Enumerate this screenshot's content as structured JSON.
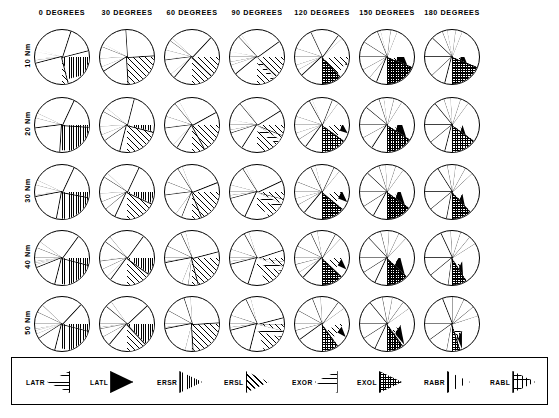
{
  "figure": {
    "title": "",
    "type": "pie-chart-matrix",
    "rows": 5,
    "columns": 7
  },
  "columns": [
    {
      "label": "0 DEGREES",
      "value": 0
    },
    {
      "label": "30 DEGREES",
      "value": 30
    },
    {
      "label": "60 DEGREES",
      "value": 60
    },
    {
      "label": "90 DEGREES",
      "value": 90
    },
    {
      "label": "120 DEGREES",
      "value": 120
    },
    {
      "label": "150 DEGREES",
      "value": 150
    },
    {
      "label": "180 DEGREES",
      "value": 180
    }
  ],
  "rows": [
    {
      "label": "10 Nm",
      "value": 10
    },
    {
      "label": "20 Nm",
      "value": 20
    },
    {
      "label": "30 Nm",
      "value": 30
    },
    {
      "label": "40 Nm",
      "value": 40
    },
    {
      "label": "50 Nm",
      "value": 50
    }
  ],
  "legend": {
    "items": [
      {
        "code": "LATR",
        "pattern": "horizontal-lines",
        "swatch": "p-latr",
        "direction": "right"
      },
      {
        "code": "LATL",
        "pattern": "solid-black",
        "swatch": "p-latl",
        "direction": "left"
      },
      {
        "code": "ERSR",
        "pattern": "dense-vertical-lines",
        "swatch": "p-ersr",
        "direction": "left"
      },
      {
        "code": "ERSL",
        "pattern": "diagonal-lines",
        "swatch": "p-ersl",
        "direction": "left"
      },
      {
        "code": "EXOR",
        "pattern": "sparse-horizontal-lines",
        "swatch": "p-exor",
        "direction": "right"
      },
      {
        "code": "EXOL",
        "pattern": "dense-crosshatch",
        "swatch": "p-exol",
        "direction": "left"
      },
      {
        "code": "RABR",
        "pattern": "blank-white",
        "swatch": "p-rabr",
        "direction": "left"
      },
      {
        "code": "RABL",
        "pattern": "square-grid",
        "swatch": "p-rabl",
        "direction": "left"
      }
    ]
  },
  "chart_data": {
    "type": "pie",
    "title": "",
    "xlabel": "",
    "ylabel": "",
    "categories": [
      "LATR",
      "LATL",
      "ERSR",
      "ERSL",
      "EXOR",
      "EXOL",
      "RABR",
      "RABL"
    ],
    "matrix_columns": [
      "0 DEGREES",
      "30 DEGREES",
      "60 DEGREES",
      "90 DEGREES",
      "120 DEGREES",
      "150 DEGREES",
      "180 DEGREES"
    ],
    "matrix_rows": [
      "10 Nm",
      "20 Nm",
      "30 Nm",
      "40 Nm",
      "50 Nm"
    ],
    "units": "percent of total",
    "start_angle_deg": -90,
    "note": "Each cell is a pie of 8 muscle-contribution categories; values are percentages estimated from wedge arcs.",
    "pies": [
      {
        "row": "10 Nm",
        "col": "0 DEGREES",
        "values": [
          3,
          2,
          41,
          52,
          1,
          0,
          0,
          1
        ]
      },
      {
        "row": "10 Nm",
        "col": "30 DEGREES",
        "values": [
          6,
          2,
          16,
          67,
          3,
          5,
          0,
          1
        ]
      },
      {
        "row": "10 Nm",
        "col": "60 DEGREES",
        "values": [
          4,
          6,
          2,
          74,
          3,
          9,
          1,
          1
        ]
      },
      {
        "row": "10 Nm",
        "col": "90 DEGREES",
        "values": [
          3,
          10,
          2,
          47,
          2,
          31,
          2,
          3
        ]
      },
      {
        "row": "10 Nm",
        "col": "120 DEGREES",
        "values": [
          5,
          13,
          1,
          16,
          3,
          54,
          3,
          5
        ]
      },
      {
        "row": "10 Nm",
        "col": "150 DEGREES",
        "values": [
          9,
          10,
          2,
          6,
          4,
          55,
          6,
          8
        ]
      },
      {
        "row": "10 Nm",
        "col": "180 DEGREES",
        "values": [
          12,
          7,
          3,
          5,
          4,
          48,
          9,
          12
        ]
      },
      {
        "row": "20 Nm",
        "col": "0 DEGREES",
        "values": [
          4,
          3,
          44,
          47,
          1,
          0,
          0,
          1
        ]
      },
      {
        "row": "20 Nm",
        "col": "30 DEGREES",
        "values": [
          8,
          3,
          18,
          61,
          4,
          5,
          0,
          1
        ]
      },
      {
        "row": "20 Nm",
        "col": "60 DEGREES",
        "values": [
          5,
          9,
          3,
          67,
          3,
          11,
          1,
          1
        ]
      },
      {
        "row": "20 Nm",
        "col": "90 DEGREES",
        "values": [
          3,
          11,
          2,
          40,
          3,
          36,
          2,
          3
        ]
      },
      {
        "row": "20 Nm",
        "col": "120 DEGREES",
        "values": [
          5,
          12,
          2,
          12,
          4,
          56,
          4,
          5
        ]
      },
      {
        "row": "20 Nm",
        "col": "150 DEGREES",
        "values": [
          11,
          9,
          3,
          6,
          5,
          51,
          7,
          8
        ]
      },
      {
        "row": "20 Nm",
        "col": "180 DEGREES",
        "values": [
          14,
          6,
          4,
          6,
          5,
          44,
          10,
          11
        ]
      },
      {
        "row": "30 Nm",
        "col": "0 DEGREES",
        "values": [
          4,
          3,
          46,
          44,
          1,
          0,
          1,
          1
        ]
      },
      {
        "row": "30 Nm",
        "col": "30 DEGREES",
        "values": [
          9,
          3,
          20,
          57,
          5,
          5,
          0,
          1
        ]
      },
      {
        "row": "30 Nm",
        "col": "60 DEGREES",
        "values": [
          6,
          10,
          3,
          62,
          4,
          13,
          1,
          1
        ]
      },
      {
        "row": "30 Nm",
        "col": "90 DEGREES",
        "values": [
          4,
          12,
          2,
          36,
          3,
          39,
          2,
          2
        ]
      },
      {
        "row": "30 Nm",
        "col": "120 DEGREES",
        "values": [
          6,
          12,
          3,
          11,
          4,
          56,
          4,
          4
        ]
      },
      {
        "row": "30 Nm",
        "col": "150 DEGREES",
        "values": [
          12,
          8,
          4,
          6,
          5,
          48,
          8,
          9
        ]
      },
      {
        "row": "30 Nm",
        "col": "180 DEGREES",
        "values": [
          16,
          6,
          5,
          6,
          5,
          40,
          11,
          11
        ]
      },
      {
        "row": "40 Nm",
        "col": "0 DEGREES",
        "values": [
          6,
          4,
          44,
          40,
          2,
          1,
          1,
          2
        ]
      },
      {
        "row": "40 Nm",
        "col": "30 DEGREES",
        "values": [
          10,
          4,
          21,
          53,
          5,
          5,
          1,
          1
        ]
      },
      {
        "row": "40 Nm",
        "col": "60 DEGREES",
        "values": [
          7,
          11,
          3,
          56,
          4,
          16,
          1,
          2
        ]
      },
      {
        "row": "40 Nm",
        "col": "90 DEGREES",
        "values": [
          5,
          12,
          3,
          32,
          3,
          41,
          2,
          2
        ]
      },
      {
        "row": "40 Nm",
        "col": "120 DEGREES",
        "values": [
          7,
          11,
          4,
          11,
          4,
          54,
          5,
          4
        ]
      },
      {
        "row": "40 Nm",
        "col": "150 DEGREES",
        "values": [
          13,
          8,
          5,
          6,
          5,
          45,
          9,
          9
        ]
      },
      {
        "row": "40 Nm",
        "col": "180 DEGREES",
        "values": [
          18,
          6,
          6,
          6,
          5,
          36,
          12,
          11
        ]
      },
      {
        "row": "50 Nm",
        "col": "0 DEGREES",
        "values": [
          7,
          5,
          42,
          37,
          3,
          2,
          1,
          3
        ]
      },
      {
        "row": "50 Nm",
        "col": "30 DEGREES",
        "values": [
          11,
          4,
          23,
          48,
          6,
          5,
          1,
          2
        ]
      },
      {
        "row": "50 Nm",
        "col": "60 DEGREES",
        "values": [
          8,
          12,
          4,
          51,
          4,
          18,
          1,
          2
        ]
      },
      {
        "row": "50 Nm",
        "col": "90 DEGREES",
        "values": [
          5,
          13,
          3,
          29,
          4,
          42,
          2,
          2
        ]
      },
      {
        "row": "50 Nm",
        "col": "120 DEGREES",
        "values": [
          8,
          11,
          5,
          11,
          5,
          51,
          5,
          4
        ]
      },
      {
        "row": "50 Nm",
        "col": "150 DEGREES",
        "values": [
          14,
          8,
          6,
          7,
          5,
          42,
          9,
          9
        ]
      },
      {
        "row": "50 Nm",
        "col": "180 DEGREES",
        "values": [
          19,
          6,
          7,
          7,
          6,
          33,
          12,
          10
        ]
      }
    ]
  }
}
